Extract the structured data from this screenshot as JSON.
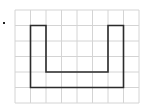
{
  "diagram": {
    "type": "grid-shape",
    "grid": {
      "columns": 8,
      "rows": 6,
      "line_color": "#d4d4d4"
    },
    "shape": {
      "name": "U-shape",
      "stroke_color": "#2b2b2b",
      "vertices_in_grid_units": [
        [
          1,
          1
        ],
        [
          2,
          1
        ],
        [
          2,
          4
        ],
        [
          6,
          4
        ],
        [
          6,
          1
        ],
        [
          7,
          1
        ],
        [
          7,
          5
        ],
        [
          1,
          5
        ]
      ]
    },
    "bullet_label": ""
  }
}
